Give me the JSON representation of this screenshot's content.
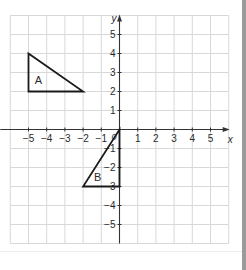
{
  "diagram": {
    "type": "coordinate-grid",
    "axes": {
      "x_label": "x",
      "y_label": "y",
      "x_range": [
        -6,
        6
      ],
      "y_range": [
        -6,
        6
      ],
      "x_ticks": [
        -5,
        -4,
        -3,
        -2,
        -1,
        1,
        2,
        3,
        4,
        5
      ],
      "y_ticks": [
        5,
        4,
        3,
        2,
        1,
        -1,
        -2,
        -3,
        -4,
        -5
      ],
      "origin_label": "0"
    },
    "shapes": [
      {
        "label": "A",
        "vertices": [
          [
            -5,
            4
          ],
          [
            -5,
            2
          ],
          [
            -2,
            2
          ]
        ],
        "label_pos": [
          -4.45,
          2.6
        ]
      },
      {
        "label": "B",
        "vertices": [
          [
            0,
            0
          ],
          [
            0,
            -3
          ],
          [
            -2,
            -3
          ]
        ],
        "label_pos": [
          -1.2,
          -2.5
        ]
      }
    ],
    "colors": {
      "grid": "#d8d8d8",
      "axis": "#333333",
      "shape": "#1a1a1a",
      "border": "#9a9a9a"
    }
  },
  "labels": {
    "x_axis": "x",
    "y_axis": "y",
    "origin": "0",
    "shape_a": "A",
    "shape_b": "B"
  }
}
